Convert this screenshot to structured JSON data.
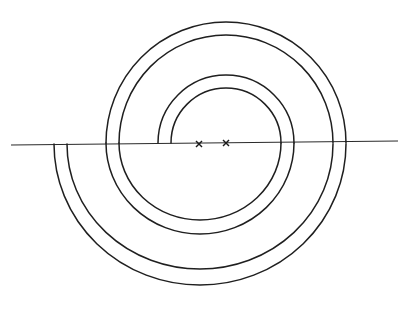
{
  "diagram": {
    "title": "",
    "stroke_color": "#1f1f1f",
    "background": "#ffffff",
    "axis_line": {
      "x1": 11,
      "y1": 145,
      "x2": 398,
      "y2": 141
    },
    "centers": [
      {
        "label": "",
        "symbol": "×",
        "x": 199,
        "y": 144
      },
      {
        "label": "",
        "symbol": "×",
        "x": 226,
        "y": 143
      }
    ],
    "arcs": [
      {
        "name": "top-inner-1",
        "cx": 226,
        "cy": 143,
        "rx": 55,
        "ry": 55,
        "side": "top"
      },
      {
        "name": "top-inner-2",
        "cx": 226,
        "cy": 143,
        "rx": 68,
        "ry": 68,
        "side": "top"
      },
      {
        "name": "bottom-middle-1",
        "cx": 200,
        "cy": 143,
        "rx": 81,
        "ry": 77,
        "side": "bottom"
      },
      {
        "name": "bottom-middle-2",
        "cx": 200,
        "cy": 143,
        "rx": 94,
        "ry": 91,
        "side": "bottom"
      },
      {
        "name": "top-outer-1",
        "cx": 226,
        "cy": 143,
        "rx": 107,
        "ry": 108,
        "side": "top"
      },
      {
        "name": "top-outer-2",
        "cx": 226,
        "cy": 143,
        "rx": 120,
        "ry": 121,
        "side": "top"
      },
      {
        "name": "bottom-outer-1",
        "cx": 200,
        "cy": 144,
        "rx": 133,
        "ry": 125,
        "side": "bottom"
      },
      {
        "name": "bottom-outer-2",
        "cx": 200,
        "cy": 144,
        "rx": 146,
        "ry": 141,
        "side": "bottom"
      }
    ]
  }
}
